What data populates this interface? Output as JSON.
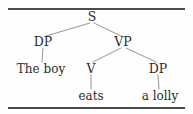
{
  "figure": {
    "type": "syntax-tree",
    "sentence": "The boy eats a lolly",
    "rules": {
      "top_label": "top-horizontal-rule",
      "bottom_label": "bottom-horizontal-rule"
    },
    "colors": {
      "background": "#fefefe",
      "text": "#2b2b2b",
      "line": "#8a8a8a",
      "rule": "#4a4a4a"
    }
  },
  "nodes": [
    {
      "id": "S",
      "label": "S",
      "kind": "category",
      "x": 92,
      "y": 17
    },
    {
      "id": "DP1",
      "label": "DP",
      "kind": "category",
      "x": 43,
      "y": 42
    },
    {
      "id": "VP",
      "label": "VP",
      "kind": "category",
      "x": 123,
      "y": 42
    },
    {
      "id": "W1",
      "label": "The boy",
      "kind": "leaf",
      "x": 41,
      "y": 69
    },
    {
      "id": "V",
      "label": "V",
      "kind": "category",
      "x": 91,
      "y": 69
    },
    {
      "id": "DP2",
      "label": "DP",
      "kind": "category",
      "x": 158,
      "y": 69
    },
    {
      "id": "W2",
      "label": "eats",
      "kind": "leaf",
      "x": 91,
      "y": 96
    },
    {
      "id": "W3",
      "label": "a lolly",
      "kind": "leaf",
      "x": 160,
      "y": 96
    }
  ],
  "edges": [
    {
      "from": "S",
      "to": "DP1",
      "x1": 90,
      "y1": 23,
      "x2": 46,
      "y2": 36
    },
    {
      "from": "S",
      "to": "VP",
      "x1": 94,
      "y1": 23,
      "x2": 121,
      "y2": 36
    },
    {
      "from": "DP1",
      "to": "W1",
      "x1": 43,
      "y1": 48,
      "x2": 42,
      "y2": 62
    },
    {
      "from": "VP",
      "to": "V",
      "x1": 121,
      "y1": 48,
      "x2": 93,
      "y2": 62
    },
    {
      "from": "VP",
      "to": "DP2",
      "x1": 126,
      "y1": 48,
      "x2": 156,
      "y2": 62
    },
    {
      "from": "V",
      "to": "W2",
      "x1": 91,
      "y1": 75,
      "x2": 91,
      "y2": 89
    },
    {
      "from": "DP2",
      "to": "W3",
      "x1": 158,
      "y1": 75,
      "x2": 159,
      "y2": 89
    }
  ]
}
